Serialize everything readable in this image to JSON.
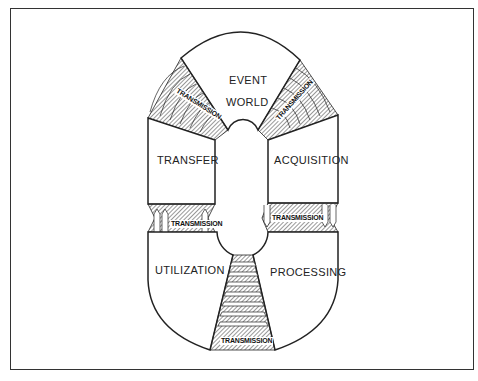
{
  "diagram": {
    "type": "process-cycle",
    "stages": [
      {
        "id": "event-world",
        "label_lines": [
          "EVENT",
          "WORLD"
        ]
      },
      {
        "id": "acquisition",
        "label": "ACQUISITION"
      },
      {
        "id": "processing",
        "label": "PROCESSING"
      },
      {
        "id": "utilization",
        "label": "UTILIZATION"
      },
      {
        "id": "transfer",
        "label": "TRANSFER"
      }
    ],
    "links": [
      {
        "from": "transfer",
        "to": "event-world",
        "label": "TRANSMISSION"
      },
      {
        "from": "event-world",
        "to": "acquisition",
        "label": "TRANSMISSION"
      },
      {
        "from": "acquisition",
        "to": "processing",
        "label": "TRANSMISSION"
      },
      {
        "from": "processing",
        "to": "utilization",
        "label": "TRANSMISSION"
      },
      {
        "from": "utilization",
        "to": "transfer",
        "label": "TRANSMISSION"
      }
    ],
    "colors": {
      "line": "#222222",
      "background": "#ffffff"
    }
  }
}
